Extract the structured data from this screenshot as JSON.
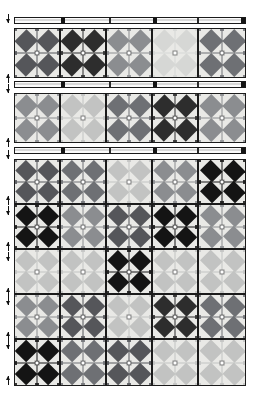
{
  "figure": {
    "type": "textile-pattern-diagram",
    "background_color": "#ffffff",
    "block_background": "#e9e9e6",
    "grid_line_color": "#4a4a4a",
    "border_color": "#1c1c1c"
  },
  "palette": {
    "black": "#141414",
    "very_dark": "#2d2d2d",
    "dark_gray": "#55565a",
    "medium_dark": "#6e7074",
    "medium_gray": "#8b8d90",
    "light_medium": "#a9abad",
    "light_gray": "#c2c3c2",
    "pale_gray": "#d6d7d5"
  },
  "separator_bars": [
    {
      "name": "top-rule",
      "x": 14,
      "y": 17,
      "width": 232,
      "height": 7,
      "ticks": [
        {
          "left": 46,
          "style": "wide"
        },
        {
          "left": 94,
          "style": "thin"
        },
        {
          "left": 138,
          "style": "wide"
        },
        {
          "left": 182,
          "style": "thin"
        },
        {
          "left": 226,
          "style": "wide"
        }
      ]
    },
    {
      "name": "middle-rule-1",
      "x": 14,
      "y": 81,
      "width": 232,
      "height": 7,
      "ticks": [
        {
          "left": 46,
          "style": "wide"
        },
        {
          "left": 94,
          "style": "thin"
        },
        {
          "left": 138,
          "style": "wide"
        },
        {
          "left": 182,
          "style": "thin"
        },
        {
          "left": 226,
          "style": "wide"
        }
      ]
    },
    {
      "name": "middle-rule-2",
      "x": 14,
      "y": 147,
      "width": 232,
      "height": 7,
      "ticks": [
        {
          "left": 46,
          "style": "wide"
        },
        {
          "left": 94,
          "style": "thin"
        },
        {
          "left": 138,
          "style": "wide"
        },
        {
          "left": 182,
          "style": "thin"
        },
        {
          "left": 226,
          "style": "wide"
        }
      ]
    }
  ],
  "edge_markers": [
    {
      "name": "marker-1",
      "top": 14,
      "dir": "down"
    },
    {
      "name": "marker-2",
      "top": 74,
      "dir": "up"
    },
    {
      "name": "marker-3",
      "top": 84,
      "dir": "down"
    },
    {
      "name": "marker-4",
      "top": 138,
      "dir": "up"
    },
    {
      "name": "marker-5",
      "top": 150,
      "dir": "down"
    },
    {
      "name": "marker-6",
      "top": 196,
      "dir": "up"
    },
    {
      "name": "marker-7",
      "top": 206,
      "dir": "down"
    },
    {
      "name": "marker-8",
      "top": 242,
      "dir": "up"
    },
    {
      "name": "marker-9",
      "top": 252,
      "dir": "down"
    },
    {
      "name": "marker-10",
      "top": 288,
      "dir": "up"
    },
    {
      "name": "marker-11",
      "top": 296,
      "dir": "down"
    },
    {
      "name": "marker-12",
      "top": 332,
      "dir": "up"
    },
    {
      "name": "marker-13",
      "top": 340,
      "dir": "down"
    },
    {
      "name": "marker-14",
      "top": 376,
      "dir": "up"
    }
  ],
  "panels": [
    {
      "name": "band-upper",
      "x": 14,
      "y": 28,
      "width": 232,
      "height": 50,
      "rows": 1,
      "cols": 5,
      "blocks": [
        [
          "dark_gray",
          "very_dark",
          "medium_gray",
          "pale_gray",
          "medium_dark"
        ]
      ]
    },
    {
      "name": "band-lower",
      "x": 14,
      "y": 93,
      "width": 232,
      "height": 50,
      "rows": 1,
      "cols": 5,
      "blocks": [
        [
          "medium_gray",
          "light_gray",
          "medium_dark",
          "very_dark",
          "medium_gray"
        ]
      ]
    },
    {
      "name": "main-grid",
      "x": 14,
      "y": 159,
      "width": 232,
      "height": 227,
      "rows": 5,
      "cols": 5,
      "blocks": [
        [
          "dark_gray",
          "medium_dark",
          "light_gray",
          "medium_gray",
          "black"
        ],
        [
          "black",
          "medium_gray",
          "dark_gray",
          "black",
          "medium_gray"
        ],
        [
          "light_gray",
          "light_gray",
          "black",
          "light_gray",
          "light_gray"
        ],
        [
          "medium_gray",
          "dark_gray",
          "light_gray",
          "very_dark",
          "medium_dark"
        ],
        [
          "black",
          "medium_dark",
          "dark_gray",
          "light_gray",
          "light_gray"
        ]
      ]
    }
  ]
}
